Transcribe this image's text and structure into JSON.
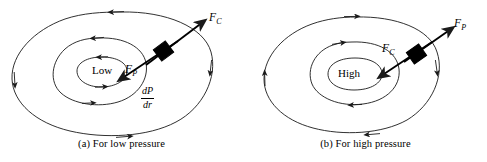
{
  "figure": {
    "background": "#ffffff",
    "stroke_color": "#1a1a1a",
    "parcel_color": "#000000"
  },
  "panels": [
    {
      "id": "a",
      "caption": "(a) For low pressure",
      "center_label": "Low",
      "pressure_center": "Low",
      "circulation": "counterclockwise",
      "inward_force": "F_P",
      "outward_force": "F_C",
      "labels": {
        "outer_force": "F",
        "outer_force_sub": "C",
        "inner_force": "F",
        "inner_force_sub": "P",
        "gradient_numerator": "dP",
        "gradient_denominator": "dr"
      }
    },
    {
      "id": "b",
      "caption": "(b) For high pressure",
      "center_label": "High",
      "pressure_center": "High",
      "circulation": "clockwise",
      "inward_force": "F_C",
      "outward_force": "F_P",
      "labels": {
        "outer_force": "F",
        "outer_force_sub": "P",
        "inner_force": "F",
        "inner_force_sub": "C"
      }
    }
  ]
}
